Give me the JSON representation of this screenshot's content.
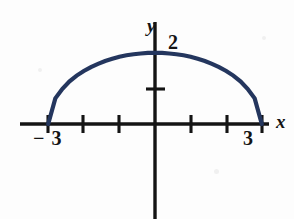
{
  "figure": {
    "background_color": "#fdfdfd",
    "axis_color": "#141414",
    "curve_color": "#24365e"
  },
  "labels": {
    "y_axis": "y",
    "x_axis": "x",
    "y_max": "2",
    "x_right": "3",
    "x_left": "− 3"
  },
  "chart_data": {
    "type": "line",
    "title": "",
    "xlabel": "x",
    "ylabel": "y",
    "xlim": [
      -3.8,
      3.2
    ],
    "ylim": [
      -2.8,
      2.4
    ],
    "grid": false,
    "legend": null,
    "equation": "y = 2*sqrt(1 - x^2/9)",
    "x_ticks": [
      -3,
      -2,
      -1,
      1,
      2,
      3
    ],
    "x_tick_labels": [
      "− 3",
      "",
      "",
      "",
      "",
      "3"
    ],
    "y_ticks": [
      1,
      2
    ],
    "y_tick_labels": [
      "",
      "2"
    ],
    "series": [
      {
        "name": "semi-ellipse",
        "color": "#24365e",
        "x": [
          -3,
          -2.8,
          -2.6,
          -2.4,
          -2.2,
          -2,
          -1.8,
          -1.6,
          -1.4,
          -1.2,
          -1,
          -0.8,
          -0.6,
          -0.4,
          -0.2,
          0,
          0.2,
          0.4,
          0.6,
          0.8,
          1,
          1.2,
          1.4,
          1.6,
          1.8,
          2,
          2.2,
          2.4,
          2.6,
          2.8,
          3
        ],
        "y": [
          0,
          0.72,
          0.99,
          1.2,
          1.36,
          1.49,
          1.6,
          1.69,
          1.77,
          1.83,
          1.89,
          1.93,
          1.96,
          1.98,
          1.996,
          2,
          1.996,
          1.98,
          1.96,
          1.93,
          1.89,
          1.83,
          1.77,
          1.69,
          1.6,
          1.49,
          1.36,
          1.2,
          0.99,
          0.72,
          0
        ]
      }
    ]
  }
}
